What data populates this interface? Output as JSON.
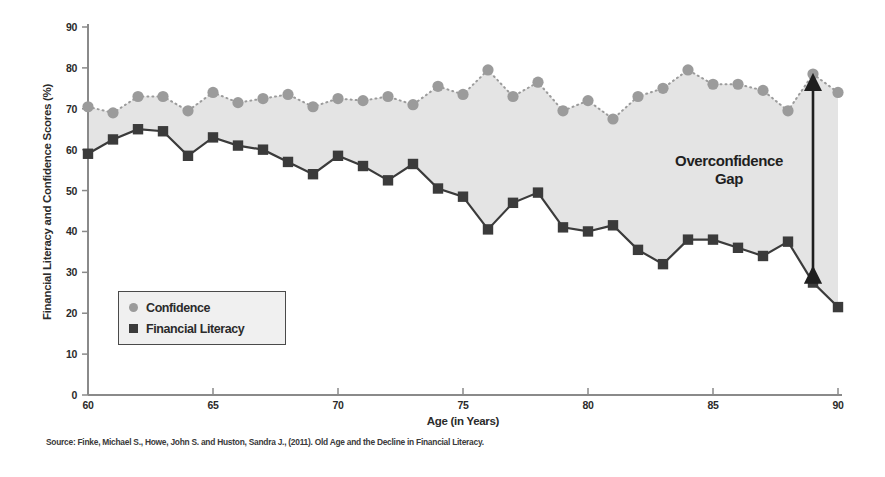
{
  "chart_data": {
    "type": "line",
    "title": "",
    "xlabel": "Age (in Years)",
    "ylabel": "Financial Literacy and Confidence Scores (%)",
    "xlim": [
      60,
      90
    ],
    "ylim": [
      0,
      90
    ],
    "xticks": [
      60,
      65,
      70,
      75,
      80,
      85,
      90
    ],
    "yticks": [
      0,
      10,
      20,
      30,
      40,
      50,
      60,
      70,
      80,
      90
    ],
    "grid": false,
    "legend_position": "lower-left-inside",
    "x": [
      60,
      61,
      62,
      63,
      64,
      65,
      66,
      67,
      68,
      69,
      70,
      71,
      72,
      73,
      74,
      75,
      76,
      77,
      78,
      79,
      80,
      81,
      82,
      83,
      84,
      85,
      86,
      87,
      88,
      89,
      90
    ],
    "series": [
      {
        "name": "Confidence",
        "marker": "circle",
        "color": "#9b9b9b",
        "linestyle": "dotted",
        "values": [
          70.5,
          69.0,
          73.0,
          73.0,
          69.5,
          74.0,
          71.5,
          72.5,
          73.5,
          70.5,
          72.5,
          72.0,
          73.0,
          71.0,
          75.5,
          73.5,
          79.5,
          73.0,
          76.5,
          69.5,
          72.0,
          67.5,
          73.0,
          75.0,
          79.5,
          76.0,
          76.0,
          74.5,
          69.5,
          78.5,
          74.0
        ]
      },
      {
        "name": "Financial Literacy",
        "marker": "square",
        "color": "#3b3b3b",
        "linestyle": "solid",
        "values": [
          59.0,
          62.5,
          65.0,
          64.5,
          58.5,
          63.0,
          61.0,
          60.0,
          57.0,
          54.0,
          58.5,
          56.0,
          52.5,
          56.5,
          50.5,
          48.5,
          40.5,
          47.0,
          49.5,
          41.0,
          40.0,
          41.5,
          35.5,
          32.0,
          38.0,
          38.0,
          36.0,
          34.0,
          37.5,
          27.5,
          21.5
        ]
      }
    ],
    "annotations": [
      {
        "name": "overconfidence-gap",
        "text_line1": "Overconfidence",
        "text_line2": "Gap",
        "arrow": "double-headed-vertical",
        "at_x": 89,
        "from_y": 27.5,
        "to_y": 78.5
      }
    ],
    "fill_between": {
      "between": [
        "Confidence",
        "Financial Literacy"
      ],
      "color": "#e4e4e4"
    }
  },
  "legend": {
    "items": [
      {
        "label": "Confidence",
        "marker": "circle",
        "color": "#9b9b9b"
      },
      {
        "label": "Financial Literacy",
        "marker": "square",
        "color": "#3b3b3b"
      }
    ]
  },
  "footer": {
    "source": "Source: Finke, Michael S., Howe, John S. and Huston, Sandra J., (2011). Old Age and the Decline in Financial Literacy."
  },
  "colors": {
    "confidence": "#9b9b9b",
    "literacy": "#3b3b3b",
    "gap_fill": "#e4e4e4",
    "axis": "#8a8a8a",
    "text": "#2b2b2b",
    "background": "#ffffff"
  }
}
